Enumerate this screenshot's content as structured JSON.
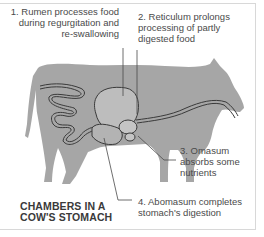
{
  "title": {
    "line1": "CHAMBERS IN A",
    "line2": "COW'S STOMACH"
  },
  "labels": [
    {
      "number": "1",
      "line1": "1. Rumen processes food",
      "line2": "during regurgitation and",
      "line3": "re-swallowing"
    },
    {
      "number": "2",
      "line1": "2. Reticulum prolongs",
      "line2": "processing of partly",
      "line3": "digested food"
    },
    {
      "number": "3",
      "line1": "3. Omasum",
      "line2": "absorbs some",
      "line3": "nutrients"
    },
    {
      "number": "4",
      "line1": "4. Abomasum completes",
      "line2": "stomach's digestion"
    }
  ],
  "colors": {
    "silhouette": "#a6a6a6",
    "organ_fill": "#bdbdbd",
    "outline": "#4a4a4a",
    "text": "#4a4a4a",
    "frame": "#d8d8d8"
  }
}
